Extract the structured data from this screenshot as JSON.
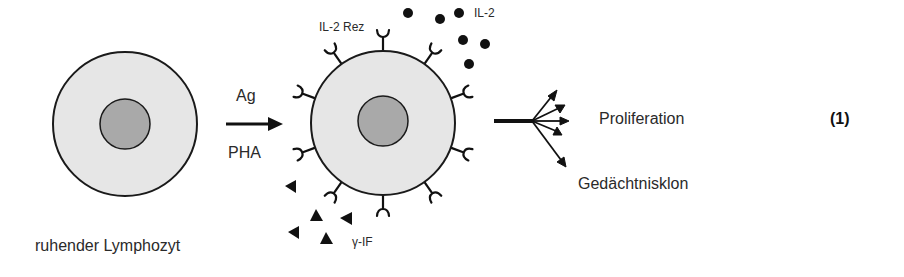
{
  "diagram": {
    "figure_number": "(1)",
    "resting_cell": {
      "label": "ruhender Lymphozyt"
    },
    "stimulus": {
      "top_label": "Ag",
      "bottom_label": "PHA"
    },
    "activated_cell": {
      "receptor_label": "IL-2 Rez",
      "cytokine_label": "IL-2",
      "interferon_label": "γ-IF"
    },
    "outcomes": {
      "proliferation": "Proliferation",
      "memory_clone": "Gedächtnisklon"
    },
    "colors": {
      "cytoplasm": "#e6e6e6",
      "nucleus": "#a9a9a9",
      "outline": "#1a1a1a",
      "text": "#2a2a2a"
    }
  }
}
